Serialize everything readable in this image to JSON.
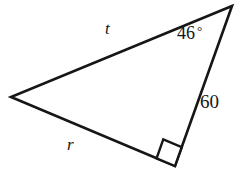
{
  "figure": {
    "kind": "right-triangle-diagram",
    "stroke_color": "#161616",
    "fill_color": "#ffffff",
    "background": "#ffffff",
    "stroke_width": 2.6,
    "labels": {
      "side_t": "t",
      "side_r": "r",
      "side_60": "60",
      "angle_value": "46",
      "degree_symbol": "°"
    },
    "vertices": {
      "apex": {
        "x": 232,
        "y": 6
      },
      "left": {
        "x": 11,
        "y": 97
      },
      "right_angle": {
        "x": 175,
        "y": 166
      }
    },
    "right_angle_marker": {
      "present": true,
      "size": 20
    }
  },
  "chart_data": {
    "type": "diagram",
    "title": "",
    "shape": "triangle",
    "annotations": [
      {
        "name": "t",
        "role": "side-label",
        "description": "side from left vertex to apex"
      },
      {
        "name": "r",
        "role": "side-label",
        "description": "side from left vertex to right-angle vertex"
      },
      {
        "name": "60",
        "role": "side-length",
        "description": "side from apex to right-angle vertex"
      },
      {
        "name": "46°",
        "role": "angle-measure",
        "description": "interior angle at apex vertex"
      },
      {
        "name": "right-angle",
        "role": "angle-marker",
        "description": "90 degree angle at bottom vertex"
      }
    ]
  }
}
